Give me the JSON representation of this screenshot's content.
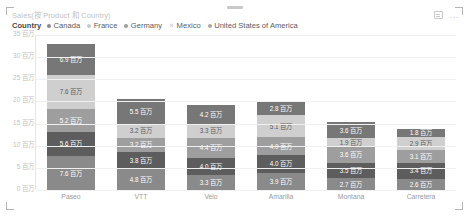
{
  "visual": {
    "title": "Sales(按 Product 和 Country)",
    "focus_icon": "focus-mode-icon",
    "more_icon": "more-options-icon",
    "more_label": "..."
  },
  "legend": {
    "title": "Country",
    "position": "top",
    "items": [
      {
        "label": "Canada",
        "color": "#8a8a8a",
        "marker": "dot"
      },
      {
        "label": "France",
        "color": "#c9c9c9",
        "marker": "dot"
      },
      {
        "label": "Germany",
        "color": "#9e9e9e",
        "marker": "dot"
      },
      {
        "label": "Mexico",
        "color": "#cfcfcf",
        "marker": "x"
      },
      {
        "label": "United States of America",
        "color": "#a8a8a8",
        "marker": "dot"
      }
    ]
  },
  "chart_data": {
    "type": "bar",
    "title": "Sales(按 Product 和 Country)",
    "xlabel": "",
    "ylabel": "",
    "stacked": true,
    "grid": true,
    "legend_position": "top",
    "ylim": [
      0,
      35
    ],
    "unit_suffix": "百万",
    "ytick_labels": [
      "0 百万",
      "5 百万",
      "10 百万",
      "15 百万",
      "20 百万",
      "25 百万",
      "30 百万",
      "35 百万"
    ],
    "ytick_values": [
      0,
      5,
      10,
      15,
      20,
      25,
      30,
      35
    ],
    "categories": [
      "Paseo",
      "VTT",
      "Velo",
      "Amarilla",
      "Montana",
      "Carretera"
    ],
    "series": [
      {
        "name": "Canada",
        "color": "#8a8a8a",
        "text": "#ffffff",
        "values": [
          7.6,
          4.8,
          3.3,
          3.9,
          2.7,
          2.6
        ],
        "labels": [
          "7.6 百万",
          "4.8 百万",
          "3.3 百万",
          "3.9 百万",
          "2.7 百万",
          "2.6 百万"
        ]
      },
      {
        "name": "France",
        "color": "#5d5d5d",
        "text": "#ffffff",
        "values": [
          5.6,
          3.8,
          4.0,
          4.0,
          3.5,
          3.4
        ],
        "labels": [
          "5.6 百万",
          "3.8 百万",
          "4.0 百万",
          "4.0 百万",
          "3.5 百万",
          "3.4 百万"
        ]
      },
      {
        "name": "Germany",
        "color": "#9e9e9e",
        "text": "#ffffff",
        "values": [
          5.2,
          3.2,
          4.4,
          4.0,
          3.6,
          3.1
        ],
        "labels": [
          "5.2 百万",
          "3.2 百万",
          "4.4 百万",
          "4.0 百万",
          "3.6 百万",
          "3.1 百万"
        ]
      },
      {
        "name": "Mexico",
        "color": "#cfcfcf",
        "text": "#5a5a5a",
        "values": [
          7.6,
          3.2,
          3.3,
          5.1,
          1.9,
          2.9
        ],
        "labels": [
          "7.6 百万",
          "3.2 百万",
          "3.3 百万",
          "5.1 百万",
          "1.9 百万",
          "2.9 百万"
        ]
      },
      {
        "name": "United States of America",
        "color": "#777777",
        "text": "#ffffff",
        "values": [
          6.9,
          5.5,
          4.2,
          2.8,
          3.6,
          1.8
        ],
        "labels": [
          "6.9 百万",
          "5.5 百万",
          "4.2 百万",
          "2.8 百万",
          "3.6 百万",
          "1.8 百万"
        ]
      }
    ]
  }
}
